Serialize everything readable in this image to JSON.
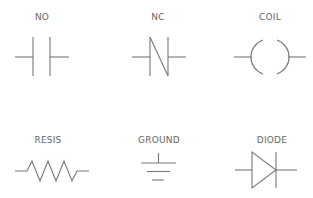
{
  "diagram": {
    "stroke_color": "#777777",
    "label_color": "#666666",
    "background": "#ffffff",
    "symbols": [
      {
        "id": "no",
        "label": "NO",
        "meaning": "normally-open contact"
      },
      {
        "id": "nc",
        "label": "NC",
        "meaning": "normally-closed contact"
      },
      {
        "id": "coil",
        "label": "COIL",
        "meaning": "relay coil"
      },
      {
        "id": "resis",
        "label": "RESIS",
        "meaning": "resistor"
      },
      {
        "id": "ground",
        "label": "GROUND",
        "meaning": "ground"
      },
      {
        "id": "diode",
        "label": "DIODE",
        "meaning": "diode"
      }
    ]
  }
}
